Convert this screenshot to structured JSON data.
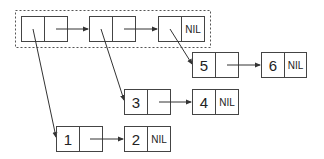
{
  "diagram": {
    "type": "linked-list-of-lists",
    "colors": {
      "stroke": "#444444",
      "text": "#222222",
      "background": "#ffffff"
    },
    "outer_list": {
      "label": "outer list (dashed frame)",
      "nodes": [
        {
          "id": "o1",
          "car": "",
          "cdr": ""
        },
        {
          "id": "o2",
          "car": "",
          "cdr": ""
        },
        {
          "id": "o3",
          "car": "",
          "cdr": "NIL"
        }
      ]
    },
    "inner_lists": [
      {
        "nodes": [
          {
            "id": "n1",
            "car": "1",
            "cdr": ""
          },
          {
            "id": "n2",
            "car": "2",
            "cdr": "NIL"
          }
        ]
      },
      {
        "nodes": [
          {
            "id": "n3",
            "car": "3",
            "cdr": ""
          },
          {
            "id": "n4",
            "car": "4",
            "cdr": "NIL"
          }
        ]
      },
      {
        "nodes": [
          {
            "id": "n5",
            "car": "5",
            "cdr": ""
          },
          {
            "id": "n6",
            "car": "6",
            "cdr": "NIL"
          }
        ]
      }
    ]
  }
}
